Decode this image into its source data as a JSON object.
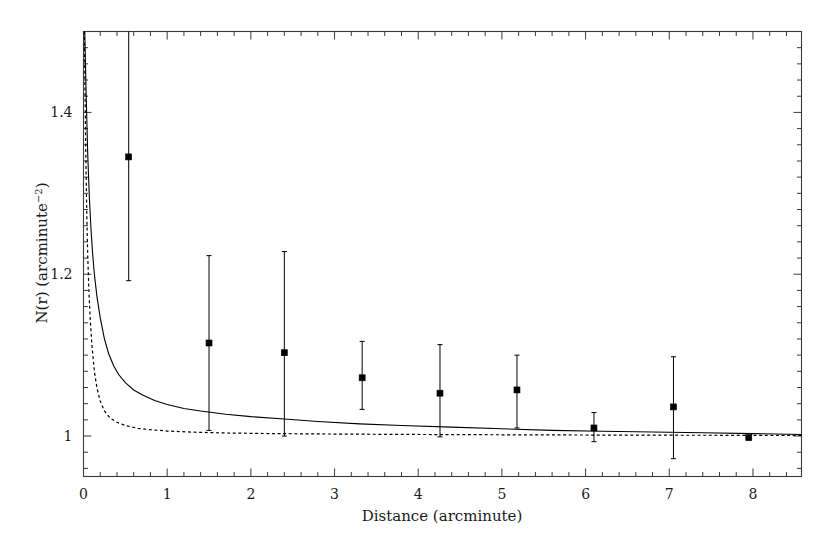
{
  "chart_data": {
    "type": "scatter",
    "title": "",
    "xlabel": "Distance (arcminute)",
    "ylabel": "N(r) (arcminute",
    "ylabel_sup": "-2",
    "ylabel_tail": ")",
    "xlim": [
      0,
      8.58
    ],
    "ylim": [
      0.95,
      1.5
    ],
    "grid": false,
    "legend": "none",
    "xticks": [
      0,
      1,
      2,
      3,
      4,
      5,
      6,
      7,
      8
    ],
    "xtick_labels": [
      "0",
      "1",
      "2",
      "3",
      "4",
      "5",
      "6",
      "7",
      "8"
    ],
    "xminor_step": 0.2,
    "yticks": [
      1.0,
      1.2,
      1.4
    ],
    "ytick_labels": [
      "1",
      "1.2",
      "1.4"
    ],
    "yminor_step": 0.02,
    "points": [
      {
        "x": 0.54,
        "y": 1.345,
        "yerr_low": 1.192,
        "yerr_high": 1.504
      },
      {
        "x": 1.5,
        "y": 1.115,
        "yerr_low": 1.007,
        "yerr_high": 1.223
      },
      {
        "x": 2.4,
        "y": 1.103,
        "yerr_low": 1.0,
        "yerr_high": 1.228
      },
      {
        "x": 3.33,
        "y": 1.072,
        "yerr_low": 1.033,
        "yerr_high": 1.117
      },
      {
        "x": 4.26,
        "y": 1.053,
        "yerr_low": 0.999,
        "yerr_high": 1.113
      },
      {
        "x": 5.18,
        "y": 1.057,
        "yerr_low": 1.01,
        "yerr_high": 1.1
      },
      {
        "x": 6.1,
        "y": 1.01,
        "yerr_low": 0.993,
        "yerr_high": 1.029
      },
      {
        "x": 7.05,
        "y": 1.036,
        "yerr_low": 0.972,
        "yerr_high": 1.098
      },
      {
        "x": 7.95,
        "y": 0.998,
        "yerr_low": 0.996,
        "yerr_high": 1.0
      }
    ],
    "series": [
      {
        "name": "solid-model-curve",
        "style": "solid",
        "color": "#000000",
        "x": [
          0.015,
          0.03,
          0.05,
          0.07,
          0.09,
          0.11,
          0.13,
          0.16,
          0.2,
          0.25,
          0.3,
          0.36,
          0.42,
          0.5,
          0.6,
          0.7,
          0.85,
          1.0,
          1.2,
          1.4,
          1.7,
          2.0,
          2.4,
          2.8,
          3.3,
          3.8,
          4.4,
          5.0,
          5.6,
          6.2,
          6.8,
          7.4,
          8.0,
          8.58
        ],
        "y": [
          1.5,
          1.43,
          1.35,
          1.295,
          1.255,
          1.224,
          1.2,
          1.173,
          1.146,
          1.12,
          1.102,
          1.087,
          1.076,
          1.066,
          1.057,
          1.051,
          1.044,
          1.039,
          1.034,
          1.031,
          1.027,
          1.024,
          1.021,
          1.018,
          1.015,
          1.013,
          1.011,
          1.009,
          1.007,
          1.006,
          1.005,
          1.004,
          1.003,
          1.002
        ]
      },
      {
        "name": "dashed-model-curve",
        "style": "dashed",
        "color": "#000000",
        "x": [
          0.01,
          0.02,
          0.03,
          0.04,
          0.05,
          0.065,
          0.08,
          0.1,
          0.13,
          0.16,
          0.2,
          0.25,
          0.32,
          0.4,
          0.5,
          0.65,
          0.8,
          1.0,
          1.3,
          1.7,
          2.2,
          2.8,
          3.5,
          4.3,
          5.2,
          6.2,
          7.2,
          8.0,
          8.58
        ],
        "y": [
          1.5,
          1.41,
          1.33,
          1.27,
          1.225,
          1.178,
          1.145,
          1.113,
          1.08,
          1.06,
          1.043,
          1.031,
          1.022,
          1.017,
          1.013,
          1.0095,
          1.0078,
          1.0062,
          1.0048,
          1.0038,
          1.0031,
          1.0026,
          1.0022,
          1.0018,
          1.0015,
          1.0012,
          1.001,
          1.0009,
          1.0008
        ]
      }
    ]
  },
  "axes": {
    "x_axis_title": "Distance (arcminute)",
    "y_axis_title_main": "N(r) (arcminute",
    "y_axis_title_sup": "−2",
    "y_axis_title_end": ")"
  },
  "colors": {
    "frame": "#3a3a3a",
    "data": "#000000",
    "background": "#ffffff"
  }
}
